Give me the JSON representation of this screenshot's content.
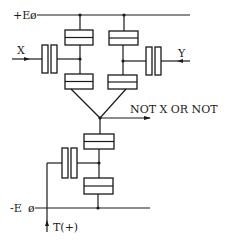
{
  "diagram": {
    "type": "circuit-schematic",
    "labels": {
      "positive_rail": "+E",
      "negative_rail": "-E",
      "input_x": "X",
      "input_y": "Y",
      "output": "NOT X OR NOT",
      "clock": "T(+)"
    },
    "rail_symbol": "ø",
    "colors": {
      "ink": "#1a1a1a",
      "background": "#ffffff"
    }
  }
}
